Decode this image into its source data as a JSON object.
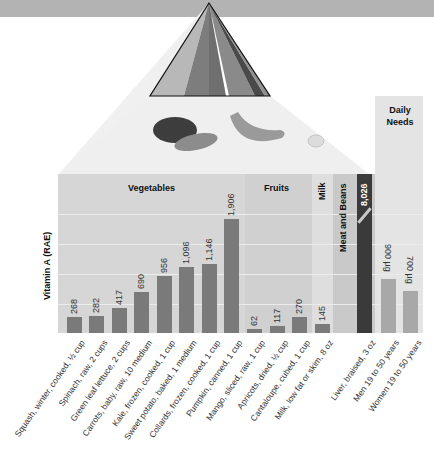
{
  "chart_data": {
    "type": "bar",
    "title": "",
    "xlabel": "",
    "ylabel": "Vitamin A (RAE)",
    "ylim": [
      0,
      2100
    ],
    "grid": true,
    "gridlines": [
      500,
      1000,
      1500,
      2000
    ],
    "sections": [
      {
        "name": "Vegetables",
        "items": [
          {
            "label": "Squash, winter, cooked, ½ cup",
            "value": 268,
            "value_label": "268"
          },
          {
            "label": "Spinach, raw, 2 cups",
            "value": 282,
            "value_label": "282"
          },
          {
            "label": "Green leaf lettuce, 2 cups",
            "value": 417,
            "value_label": "417"
          },
          {
            "label": "Carrots, baby, raw, 10 medium",
            "value": 690,
            "value_label": "690"
          },
          {
            "label": "Kale, frozen, cooked, 1 cup",
            "value": 956,
            "value_label": "956"
          },
          {
            "label": "Sweet potato, baked, 1 medium",
            "value": 1096,
            "value_label": "1,096"
          },
          {
            "label": "Collards, frozen, cooked, 1 cup",
            "value": 1146,
            "value_label": "1,146"
          },
          {
            "label": "Pumpkin, canned, 1 cup",
            "value": 1906,
            "value_label": "1,906"
          }
        ]
      },
      {
        "name": "Fruits",
        "items": [
          {
            "label": "Mango, sliced, raw, 1 cup",
            "value": 62,
            "value_label": "62"
          },
          {
            "label": "Apricots, dried, ½ cup",
            "value": 117,
            "value_label": "117"
          },
          {
            "label": "Cantaloupe, cubed, 1 cup",
            "value": 270,
            "value_label": "270"
          }
        ]
      },
      {
        "name": "Milk",
        "items": [
          {
            "label": "Milk, low fat or skim, 8 oz",
            "value": 145,
            "value_label": "145"
          }
        ]
      },
      {
        "name": "Meat and Beans",
        "items": [
          {
            "label": "Liver, braised, 3 oz",
            "value": 8026,
            "value_label": "8,026",
            "truncated": true
          }
        ]
      },
      {
        "name": "Daily Needs",
        "items": [
          {
            "label": "Men 19 to 50 years",
            "value": 900,
            "value_label": "900 µg"
          },
          {
            "label": "Women 19 to 50 years",
            "value": 700,
            "value_label": "700 µg"
          }
        ]
      }
    ]
  },
  "colors": {
    "top_band": "#b3b3b3",
    "panel_bg": "#d6d6d6",
    "milk_bg": "#dedede",
    "meat_bg": "#c9c9c9",
    "daily_bg": "#e4e4e4",
    "bar_food": "#7a7a7a",
    "bar_liver": "#3a3a3a",
    "bar_daily": "#a8a8a8"
  }
}
